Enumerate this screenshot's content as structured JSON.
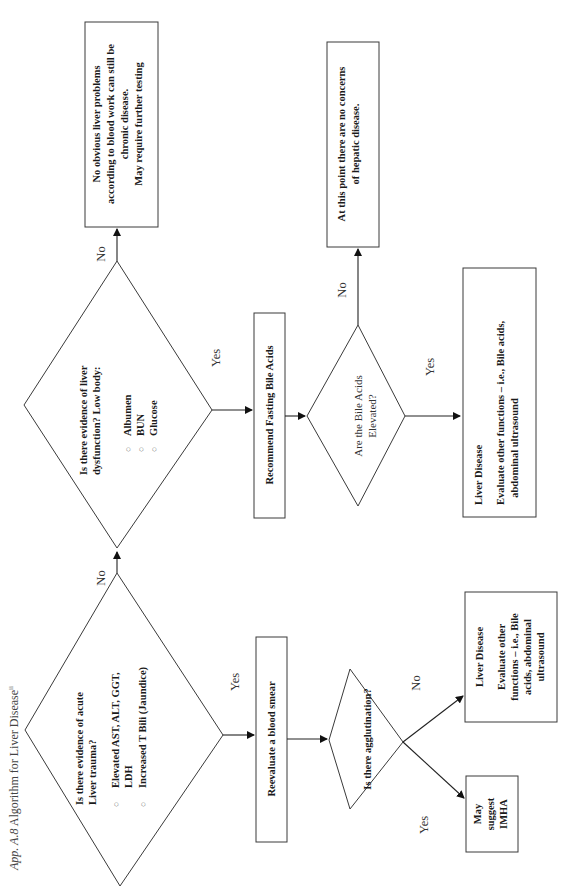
{
  "caption": {
    "prefix": "App. A.8",
    "title": "Algorithm for Liver Disease",
    "superscript": "ii"
  },
  "nodes": {
    "acute_trauma": {
      "type": "decision",
      "question_line1": "Is there evidence of acute",
      "question_line2": "Liver trauma?",
      "bullets": [
        "Elevated AST, ALT, GGT,",
        "LDH",
        "Increased T Bili (Jaundice)"
      ]
    },
    "liver_dysfunction": {
      "type": "decision",
      "question_line1": "Is there evidence of liver",
      "question_line2": "dysfunction?   Low body:",
      "bullets": [
        "Albumen",
        "BUN",
        "Glucose"
      ]
    },
    "no_obvious": {
      "type": "outcome",
      "lines": [
        "No obvious liver problems",
        "according to blood work can still be",
        "chronic disease.",
        "May require further testing"
      ]
    },
    "recommend_bile": {
      "type": "process",
      "label": "Recommend Fasting Bile Acids"
    },
    "bile_elevated": {
      "type": "decision",
      "line1": "Are the Bile Acids",
      "line2": "Elevated?"
    },
    "no_concerns": {
      "type": "outcome",
      "lines": [
        "At this point there are no concerns",
        "of hepatic disease."
      ]
    },
    "liver_disease_a": {
      "type": "outcome",
      "title": "Liver Disease",
      "lines": [
        "Evaluate other functions – i.e., Bile acids,",
        "abdominal ultrasound"
      ]
    },
    "reevaluate_smear": {
      "type": "process",
      "label": "Reevaluate a blood smear"
    },
    "agglutination": {
      "type": "decision",
      "label": "Is there agglutination?"
    },
    "liver_disease_b": {
      "type": "outcome",
      "title": "Liver Disease",
      "lines": [
        "Evaluate other",
        "functions – i.e., Bile",
        "acids, abdominal",
        "ultrasound"
      ]
    },
    "imha": {
      "type": "outcome",
      "lines": [
        "May",
        "suggest",
        "IMHA"
      ]
    }
  },
  "edges": {
    "acute_no": "No",
    "acute_yes": "Yes",
    "dysfunction_no": "No",
    "dysfunction_yes": "Yes",
    "bile_no": "No",
    "bile_yes": "Yes",
    "agglut_no": "No",
    "agglut_yes": "Yes"
  },
  "colors": {
    "stroke": "#3a3a3a",
    "text": "#1a1a1a",
    "background": "#ffffff"
  }
}
